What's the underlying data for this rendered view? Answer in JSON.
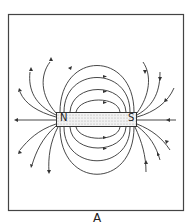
{
  "figure": {
    "caption": "A",
    "magnet": {
      "north_label": "N",
      "south_label": "S"
    },
    "colors": {
      "line": "#333333",
      "frame": "#444444",
      "magnet_fill": "#e8e8e8"
    }
  }
}
